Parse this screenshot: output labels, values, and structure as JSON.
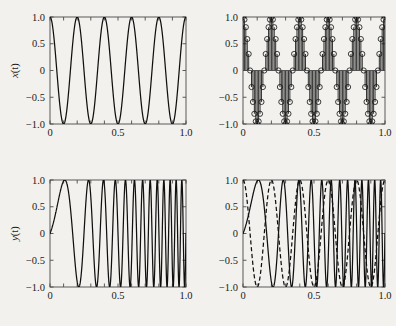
{
  "figure": {
    "background_color": "#f2f1ed",
    "ink_color": "#101010",
    "axis_color": "#4a4a4a",
    "panels": [
      "top-left",
      "top-right",
      "bottom-left",
      "bottom-right"
    ]
  },
  "axes": {
    "xlabel_italic": "t",
    "xlabel_rest": "(sec)",
    "xticks": [
      0,
      0.5,
      1.0
    ],
    "xticklabels": [
      "0",
      "0.5",
      "1.0"
    ],
    "yticks": [
      1.0,
      0.5,
      0,
      -0.5,
      -1.0
    ],
    "yticklabels": [
      "1.0",
      "0.5",
      "0",
      "-0.5",
      "-1.0"
    ],
    "xlim": [
      0,
      1
    ],
    "ylim": [
      -1,
      1
    ],
    "xminor_count": 10,
    "grid": false
  },
  "labels": {
    "y_top_italic": "x",
    "y_top_rest": "(t)",
    "y_bottom_italic": "y",
    "y_bottom_rest": "(t)",
    "xaxis_text": "t(sec)"
  },
  "chart_data": [
    {
      "id": "top-left",
      "type": "line",
      "title": "",
      "xlabel": "t(sec)",
      "ylabel": "x(t)",
      "xlim": [
        0,
        1
      ],
      "ylim": [
        -1,
        1
      ],
      "grid": false,
      "legend": "none",
      "series": [
        {
          "name": "x(t) = cos(2*pi*5*t)",
          "style": "solid",
          "function": "cos",
          "frequency_hz": 5,
          "amplitude": 1,
          "phase_rad": 0,
          "samples": 800
        }
      ],
      "annotations": [
        "5 full cosine cycles over 0 to 1 s"
      ]
    },
    {
      "id": "top-right",
      "type": "stem",
      "title": "",
      "xlabel": "t(sec)",
      "ylabel": "",
      "xlim": [
        0,
        1
      ],
      "ylim": [
        -1,
        1
      ],
      "grid": false,
      "legend": "none",
      "series": [
        {
          "name": "x[n] = cos(2*pi*5*n/N)",
          "style": "stem-circle-marker",
          "function": "cos",
          "frequency_hz": 5,
          "amplitude": 1,
          "phase_rad": 0,
          "samples": 101,
          "marker": "open-circle",
          "marker_radius_px": 2.6
        }
      ],
      "annotations": [
        "Discrete-time stem plot of the 5 Hz cosine, densely sampled"
      ]
    },
    {
      "id": "bottom-left",
      "type": "line",
      "title": "",
      "xlabel": "t(sec)",
      "ylabel": "y(t)",
      "xlim": [
        0,
        1
      ],
      "ylim": [
        -1,
        1
      ],
      "grid": false,
      "legend": "none",
      "series": [
        {
          "name": "y(t) = sin(2*pi*(f0*t + (k/2)*t^2))",
          "style": "solid",
          "function": "chirp-sin",
          "f_start_hz": 1,
          "f_end_hz": 25,
          "amplitude": 1,
          "phase_rad": 0,
          "samples": 2400
        }
      ],
      "annotations": [
        "Linear frequency sweep: slow at t=0, fastest near t=1"
      ]
    },
    {
      "id": "bottom-right",
      "type": "line",
      "title": "",
      "xlabel": "t(sec)",
      "ylabel": "",
      "xlim": [
        0,
        1
      ],
      "ylim": [
        -1,
        1
      ],
      "grid": false,
      "legend": "none",
      "series": [
        {
          "name": "y(t) chirp",
          "style": "solid",
          "function": "chirp-sin",
          "f_start_hz": 1,
          "f_end_hz": 25,
          "amplitude": 1,
          "phase_rad": 0,
          "samples": 2400
        },
        {
          "name": "x(t) = cos(2*pi*5*t)",
          "style": "dashed",
          "function": "cos",
          "frequency_hz": 5,
          "amplitude": 1,
          "phase_rad": 0,
          "samples": 1200
        }
      ],
      "annotations": [
        "Chirp (solid) overlaid with 5 Hz cosine (dashed)"
      ]
    }
  ]
}
